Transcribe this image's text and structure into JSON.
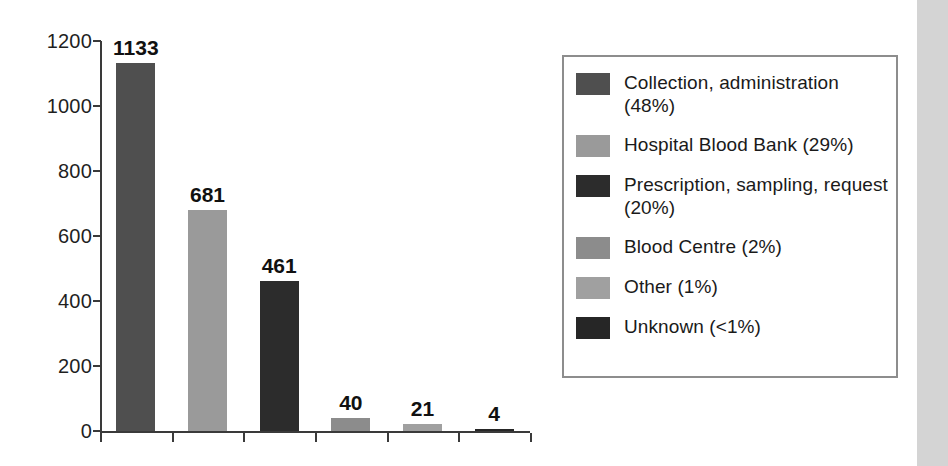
{
  "chart_data": {
    "type": "bar",
    "title": "",
    "subtitle": "",
    "xlabel": "",
    "ylabel": "",
    "ylim": [
      0,
      1200
    ],
    "ytick_labels": [
      "1200",
      "1000",
      "800",
      "600",
      "400",
      "200",
      "0"
    ],
    "ytick_values": [
      1200,
      1000,
      800,
      600,
      400,
      200,
      0
    ],
    "grid": false,
    "legend_position": "right",
    "categories": [
      "Collection, administration",
      "Hospital Blood Bank",
      "Prescription, sampling, request",
      "Blood Centre",
      "Other",
      "Unknown"
    ],
    "values": [
      1133,
      681,
      461,
      40,
      21,
      4
    ],
    "value_labels": [
      "1133",
      "681",
      "461",
      "40",
      "21",
      "4"
    ],
    "percent_labels": [
      "48%",
      "29%",
      "20%",
      "2%",
      "1%",
      "<1%"
    ],
    "bar_colors": [
      "#4f4f4f",
      "#9a9a9a",
      "#2c2c2c",
      "#8c8c8c",
      "#a0a0a0",
      "#262626"
    ]
  },
  "legend": {
    "items": [
      {
        "label": "Collection, administration (48%)",
        "color": "#4f4f4f"
      },
      {
        "label": "Hospital Blood Bank (29%)",
        "color": "#9a9a9a"
      },
      {
        "label": "Prescription, sampling, request (20%)",
        "color": "#2c2c2c"
      },
      {
        "label": "Blood Centre (2%)",
        "color": "#8c8c8c"
      },
      {
        "label": "Other (1%)",
        "color": "#a0a0a0"
      },
      {
        "label": "Unknown (<1%)",
        "color": "#262626"
      }
    ]
  },
  "axis": {
    "line_color": "#3a3a3a"
  }
}
